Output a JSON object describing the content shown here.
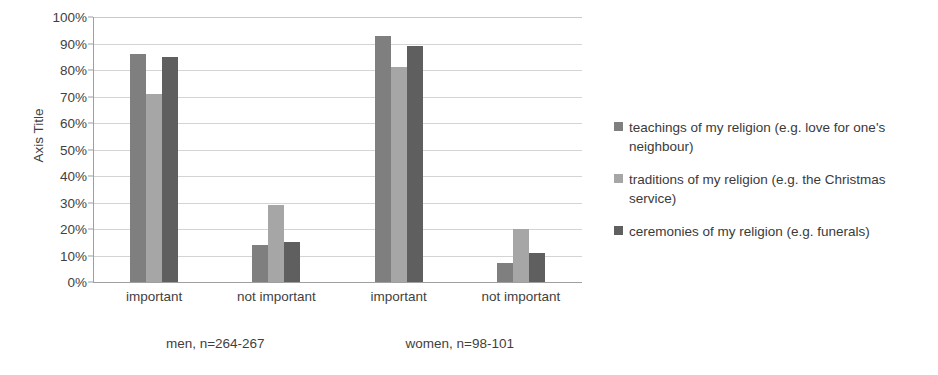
{
  "chart_data": {
    "type": "bar",
    "title": "",
    "subtitle": "",
    "xlabel": "",
    "ylabel": "Axis Title",
    "ylim": [
      0,
      100
    ],
    "yunit": "%",
    "grid": true,
    "legend_position": "right",
    "categories": [
      "important",
      "not important",
      "important",
      "not important"
    ],
    "groups": [
      {
        "label": "men, n=264-267",
        "categories": [
          "important",
          "not important"
        ]
      },
      {
        "label": "women, n=98-101",
        "categories": [
          "important",
          "not important"
        ]
      }
    ],
    "series": [
      {
        "name": "teachings of my religion (e.g. love for one's neighbour)",
        "color": "#7f7f7f",
        "values": [
          86,
          14,
          93,
          7
        ]
      },
      {
        "name": "traditions of my religion (e.g. the Christmas service)",
        "color": "#a6a6a6",
        "values": [
          71,
          29,
          81,
          20
        ]
      },
      {
        "name": "ceremonies of my religion (e.g. funerals)",
        "color": "#5f5f5f",
        "values": [
          85,
          15,
          89,
          11
        ]
      }
    ],
    "yticks": [
      "0%",
      "10%",
      "20%",
      "30%",
      "40%",
      "50%",
      "60%",
      "70%",
      "80%",
      "90%",
      "100%"
    ],
    "ytick_values": [
      0,
      10,
      20,
      30,
      40,
      50,
      60,
      70,
      80,
      90,
      100
    ]
  },
  "axis": {
    "y_title": "Axis Title"
  },
  "legend": {
    "items": [
      {
        "label": "teachings of my religion (e.g. love for one's neighbour)",
        "color": "#7f7f7f"
      },
      {
        "label": "traditions of my religion (e.g. the Christmas service)",
        "color": "#a6a6a6"
      },
      {
        "label": "ceremonies of my religion (e.g. funerals)",
        "color": "#5f5f5f"
      }
    ]
  }
}
